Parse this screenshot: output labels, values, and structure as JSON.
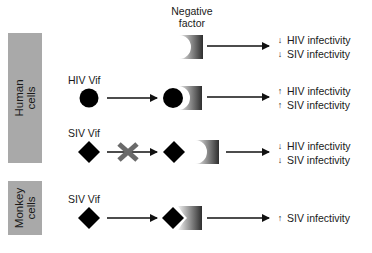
{
  "negative_factor": {
    "title_line1": "Negative",
    "title_line2": "factor"
  },
  "sidebars": {
    "human": {
      "line1": "Human",
      "line2": "cells",
      "color": "#a9a9a9"
    },
    "monkey": {
      "line1": "Monkey",
      "line2": "cells",
      "color": "#a9a9a9"
    }
  },
  "rows": [
    {
      "label": "",
      "results": [
        {
          "direction": "down",
          "arrow": "↓",
          "text": "HIV infectivity"
        },
        {
          "direction": "down",
          "arrow": "↓",
          "text": "SIV infectivity"
        }
      ]
    },
    {
      "label": "HIV Vif",
      "results": [
        {
          "direction": "up",
          "arrow": "↑",
          "text": "HIV infectivity"
        },
        {
          "direction": "up",
          "arrow": "↑",
          "text": "SIV infectivity"
        }
      ]
    },
    {
      "label": "SIV Vif",
      "results": [
        {
          "direction": "down",
          "arrow": "↓",
          "text": "HIV infectivity"
        },
        {
          "direction": "down",
          "arrow": "↓",
          "text": "SIV infectivity"
        }
      ]
    },
    {
      "label": "SIV Vif",
      "results": [
        {
          "direction": "up",
          "arrow": "↑",
          "text": "SIV infectivity"
        }
      ]
    }
  ],
  "colors": {
    "shape_black": "#000000",
    "factor_dark": "#3a3a3a",
    "factor_light": "#e8e8e8",
    "x_mark": "#666666"
  }
}
